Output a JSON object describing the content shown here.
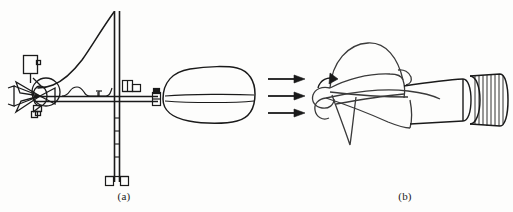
{
  "figure": {
    "background_color": "#fdfdfc",
    "ink_color": "#1a1a1a",
    "width": 513,
    "height": 212,
    "panels": [
      {
        "id": "a",
        "caption": "(a)",
        "description": "cup anemometer and wind vane assembly mounted on a vertical mast"
      },
      {
        "id": "b",
        "caption": "(b)",
        "description": "propeller vane anemometer with incoming wind flow arrows and rotation arrow"
      }
    ]
  },
  "panel_a": {
    "caption": "(a)",
    "parts": {
      "cup_rotor": "cup-rotor",
      "sensor_box": "sensor-box",
      "cable": "cable",
      "mast": "mast",
      "mast_base": "mast-base",
      "crossarm": "crossarm",
      "vane_tail": "vane-tail",
      "vane_pivot": "vane-pivot",
      "fitting": "crossarm-fitting"
    }
  },
  "panel_b": {
    "caption": "(b)",
    "flow_arrows": {
      "count": 3,
      "direction": "left-to-right",
      "label": "wind-flow-arrows"
    },
    "parts": {
      "propeller": "propeller-blades",
      "hub": "propeller-hub",
      "rotation_arrow": "rotation-arrow",
      "body": "tapered-body",
      "ribbed_tail": "ribbed-tail-housing"
    }
  }
}
